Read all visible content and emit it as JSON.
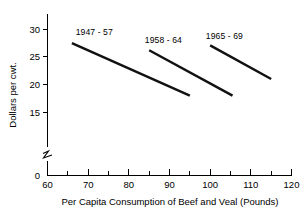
{
  "chart_data": {
    "type": "line",
    "title": "",
    "subtitle": "",
    "xlabel": "Per Capita Consumption of Beef and Veal (Pounds)",
    "ylabel": "Dollars per cwt.",
    "xlim": [
      60,
      120
    ],
    "ylim": [
      15,
      31
    ],
    "y_axis_break": true,
    "y_axis_zero_label": "0",
    "grid": false,
    "legend_position": "inline-annotations",
    "x_ticks_major": [
      60,
      70,
      80,
      90,
      100,
      110,
      120
    ],
    "x_ticks_minor": [
      65,
      75,
      85,
      95,
      105,
      115
    ],
    "y_ticks_major": [
      15,
      20,
      25,
      30
    ],
    "x_tick_labels": [
      "60",
      "70",
      "80",
      "90",
      "100",
      "110",
      "120"
    ],
    "y_tick_labels": [
      "15",
      "20",
      "25",
      "30"
    ],
    "series": [
      {
        "name": "1947 - 57",
        "label": "1947 - 57",
        "label_x": 71.5,
        "label_y": 29.0,
        "x": [
          66.0,
          95.0
        ],
        "y": [
          27.5,
          18.0
        ]
      },
      {
        "name": "1958 - 64",
        "label": "1958 - 64",
        "label_x": 88.5,
        "label_y": 27.5,
        "x": [
          85.0,
          105.5
        ],
        "y": [
          26.2,
          18.0
        ]
      },
      {
        "name": "1965 - 69",
        "label": "1965 - 69",
        "label_x": 103.5,
        "label_y": 28.3,
        "x": [
          100.0,
          115.0
        ],
        "y": [
          27.1,
          21.0
        ]
      }
    ]
  },
  "colors": {
    "line": "#111111",
    "axis": "#000000",
    "background": "#ffffff",
    "text": "#000000"
  }
}
